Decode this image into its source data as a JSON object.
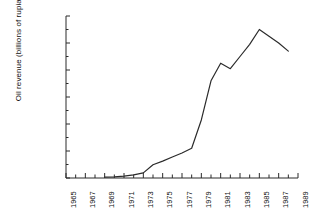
{
  "chart_data": {
    "type": "line",
    "title": "",
    "xlabel": "",
    "ylabel": "Oil revenue (billions of rupiahs)",
    "xlim": [
      1965,
      1989
    ],
    "ylim": [
      0,
      12000
    ],
    "grid": false,
    "legend": "none",
    "y_ticks": [
      0,
      2000,
      4000,
      6000,
      8000,
      10000,
      12000
    ],
    "y_tick_labels": [
      "0",
      "2000",
      "4000",
      "6000",
      "8000",
      "10000",
      "12000"
    ],
    "y_minor_tick_step": 1000,
    "x_ticks": [
      1965,
      1966,
      1967,
      1968,
      1969,
      1970,
      1971,
      1972,
      1973,
      1974,
      1975,
      1976,
      1977,
      1978,
      1979,
      1980,
      1981,
      1982,
      1983,
      1984,
      1985,
      1986,
      1987,
      1988,
      1989
    ],
    "x_tick_labels": [
      "1965",
      "1967",
      "1969",
      "1971",
      "1973",
      "1975",
      "1977",
      "1979",
      "1981",
      "1983",
      "1985",
      "1987",
      "1989"
    ],
    "x_tick_label_years": [
      1965,
      1967,
      1969,
      1971,
      1973,
      1975,
      1977,
      1979,
      1981,
      1983,
      1985,
      1987,
      1989
    ],
    "line_color": "#2b2b2b",
    "series": [
      {
        "name": "Oil revenue",
        "x": [
          1969,
          1970,
          1971,
          1972,
          1973,
          1974,
          1975,
          1976,
          1977,
          1978,
          1979,
          1980,
          1981,
          1982,
          1983,
          1984,
          1985,
          1986,
          1987,
          1988
        ],
        "values": [
          60,
          90,
          140,
          230,
          380,
          980,
          1250,
          1550,
          1850,
          2200,
          4300,
          7200,
          8500,
          8100,
          9000,
          9900,
          11000,
          10500,
          10000,
          9400
        ]
      }
    ]
  },
  "axis_style": {
    "axis_color": "#2b2b2b",
    "background": "#ffffff"
  }
}
